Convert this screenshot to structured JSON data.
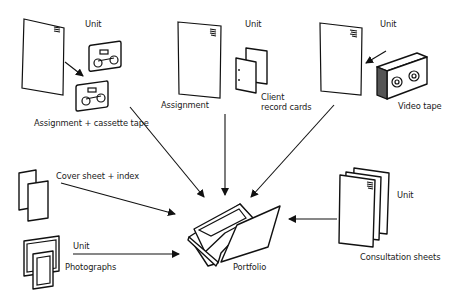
{
  "diagram": {
    "center": {
      "label": "Portfolio",
      "icon": "portfolio-box-icon"
    },
    "sources": [
      {
        "id": "assignment-cassette",
        "label": "Assignment + cassette tape",
        "unit_label": "Unit",
        "icons": [
          "unit-sheet-icon",
          "cassette-tape-icon",
          "cassette-tape-icon"
        ]
      },
      {
        "id": "assignment-cards",
        "label": "Assignment",
        "secondary_label_line1": "Client",
        "secondary_label_line2": "record cards",
        "unit_label": "Unit",
        "icons": [
          "unit-sheet-icon",
          "record-cards-icon"
        ]
      },
      {
        "id": "video",
        "label": "Video tape",
        "unit_label": "Unit",
        "icons": [
          "unit-sheet-icon",
          "video-tape-icon"
        ]
      },
      {
        "id": "cover-index",
        "label": "Cover sheet + index",
        "icons": [
          "cover-sheets-icon"
        ]
      },
      {
        "id": "photographs",
        "label": "Photographs",
        "unit_label": "Unit",
        "icons": [
          "photographs-icon"
        ]
      },
      {
        "id": "consultation",
        "label": "Consultation sheets",
        "unit_label": "Unit",
        "icons": [
          "consultation-sheets-icon"
        ]
      }
    ],
    "connections": [
      {
        "from": "assignment-cassette",
        "to": "portfolio"
      },
      {
        "from": "assignment-cards",
        "to": "portfolio"
      },
      {
        "from": "video",
        "to": "portfolio"
      },
      {
        "from": "cover-index",
        "to": "portfolio"
      },
      {
        "from": "photographs",
        "to": "portfolio"
      },
      {
        "from": "consultation",
        "to": "portfolio"
      }
    ]
  }
}
